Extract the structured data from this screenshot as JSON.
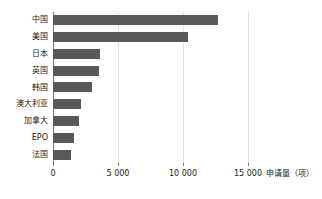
{
  "chart_data": {
    "type": "bar",
    "orientation": "horizontal",
    "title": "",
    "xlabel": "申请量（项）",
    "ylabel": "",
    "categories": [
      "中国",
      "美国",
      "日本",
      "英国",
      "韩国",
      "澳大利亚",
      "加拿大",
      "EPO",
      "法国"
    ],
    "values": [
      12700,
      10400,
      3600,
      3550,
      3000,
      2150,
      2000,
      1600,
      1400
    ],
    "xlim": [
      0,
      16500
    ],
    "xticks": [
      0,
      5000,
      10000,
      15000
    ],
    "xtick_labels": [
      "0",
      "5 000",
      "10 000",
      "15 000"
    ],
    "grid": "vertical-major",
    "legend": "none",
    "bar_color": "#595959",
    "axis_color": "#7b7b7b",
    "gridline_color": "#e4e4e4",
    "background": "#ffffff"
  },
  "axis": {
    "title": "申请量（项）"
  }
}
